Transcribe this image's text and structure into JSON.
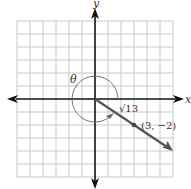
{
  "figure": {
    "type": "angle-in-standard-position",
    "axes": {
      "x_label": "x",
      "y_label": "y"
    },
    "grid": {
      "min": -6,
      "max": 6,
      "step": 1
    },
    "angle_label": "θ",
    "terminal_point": {
      "x": 3,
      "y": -2,
      "label": "(3, −2)"
    },
    "radius_label": "√13",
    "colors": {
      "grid": "#c8c8c8",
      "axes": "#111111",
      "ray": "#555555",
      "arc": "#666666",
      "text": "#333333"
    }
  }
}
